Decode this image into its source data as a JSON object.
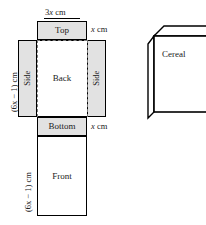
{
  "figure": {
    "net": {
      "panels": [
        {
          "id": "top",
          "label": "Top",
          "fill": "shaded"
        },
        {
          "id": "side-left",
          "label": "Side",
          "fill": "shaded"
        },
        {
          "id": "back",
          "label": "Back",
          "fill": "white"
        },
        {
          "id": "side-right",
          "label": "Side",
          "fill": "shaded"
        },
        {
          "id": "bottom",
          "label": "Bottom",
          "fill": "shaded"
        },
        {
          "id": "front",
          "label": "Front",
          "fill": "white"
        }
      ],
      "labels": {
        "top_width": "3x cm",
        "top_width_coeff": "3",
        "top_width_var": "x",
        "top_width_unit": "cm",
        "top_flap_depth": "x cm",
        "top_flap_depth_var": "x",
        "top_flap_depth_unit": "cm",
        "bottom_flap_depth": "x cm",
        "bottom_flap_depth_var": "x",
        "bottom_flap_depth_unit": "cm",
        "back_height": "(6x − 1) cm",
        "front_height": "(6x − 1) cm"
      }
    },
    "box3d": {
      "label": "Cereal"
    },
    "colors": {
      "stroke": "#000000",
      "shaded_fill": "#e2e2e2",
      "white_fill": "#ffffff",
      "fold_line": "#7a7a7a"
    }
  }
}
